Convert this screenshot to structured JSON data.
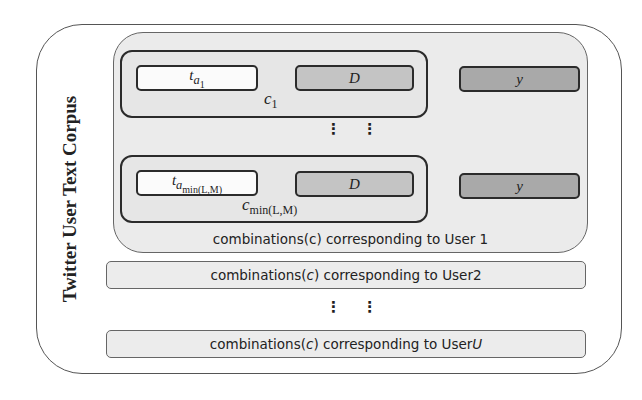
{
  "corpus": {
    "title": "Twitter User Text Corpus"
  },
  "user1": {
    "combinations": [
      {
        "text_field": "t",
        "text_sub": "a",
        "text_subsub": "1",
        "domain_field": "D",
        "label_field": "y",
        "combo_label": "c",
        "combo_sub": "1"
      },
      {
        "text_field": "t",
        "text_sub": "a",
        "text_subsub": "min(L,M)",
        "domain_field": "D",
        "label_field": "y",
        "combo_label": "c",
        "combo_sub": "min(L,M)"
      }
    ],
    "ellipsis": "⋮ ⋮",
    "caption": "combinations(c) corresponding to User 1"
  },
  "users": [
    {
      "caption_prefix": "combinations(",
      "caption_var": "c",
      "caption_mid": ") corresponding to User ",
      "caption_user": "2",
      "user_italic": false
    },
    {
      "caption_prefix": "combinations(",
      "caption_var": "c",
      "caption_mid": ") corresponding to User ",
      "caption_user": "U",
      "user_italic": true
    }
  ],
  "between_users_ellipsis": "⋮ ⋮",
  "colors": {
    "outer_border": "#555555",
    "user1_bg": "#ebebeb",
    "text_field_bg": "#fbfbfb",
    "domain_field_bg": "#c4c4c4",
    "label_field_bg": "#a9a9a9",
    "bar_bg": "#ececec"
  }
}
